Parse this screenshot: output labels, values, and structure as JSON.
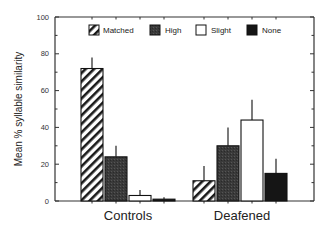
{
  "chart_data": {
    "type": "bar",
    "title": "",
    "xlabel": "",
    "ylabel": "Mean % syllable similarity",
    "ylim": [
      0,
      100
    ],
    "yticks": [
      0,
      20,
      40,
      60,
      80,
      100
    ],
    "grid": false,
    "legend_position": "top-inside",
    "categories": [
      "Controls",
      "Deafened"
    ],
    "series": [
      {
        "name": "Matched",
        "fill": "hatched",
        "values": [
          72,
          11
        ],
        "error_upper": [
          78,
          19
        ]
      },
      {
        "name": "High",
        "fill": "#3a3a3a",
        "values": [
          24,
          30
        ],
        "error_upper": [
          30,
          40
        ]
      },
      {
        "name": "Slight",
        "fill": "#ffffff",
        "values": [
          3,
          44
        ],
        "error_upper": [
          6,
          55
        ]
      },
      {
        "name": "None",
        "fill": "#151515",
        "values": [
          1,
          15
        ],
        "error_upper": [
          2,
          23
        ]
      }
    ]
  },
  "legend": {
    "items": [
      {
        "label": "Matched"
      },
      {
        "label": "High"
      },
      {
        "label": "Slight"
      },
      {
        "label": "None"
      }
    ]
  },
  "axes": {
    "y_title": "Mean % syllable similarity",
    "y_tick_labels": [
      "0",
      "20",
      "40",
      "60",
      "80",
      "100"
    ],
    "x_category_labels": [
      "Controls",
      "Deafened"
    ]
  }
}
